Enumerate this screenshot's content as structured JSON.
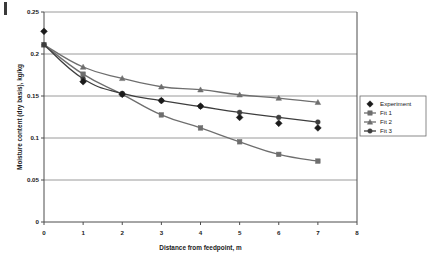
{
  "chart_data": {
    "type": "line",
    "title": "",
    "xlabel": "Distance from feedpoint, m",
    "ylabel": "Moisture content (dry basis), kg/kg",
    "xlim": [
      0,
      8
    ],
    "ylim": [
      0,
      0.25
    ],
    "xticks": [
      "0",
      "1",
      "2",
      "3",
      "4",
      "5",
      "6",
      "7",
      "8"
    ],
    "xtick_values": [
      0,
      1,
      2,
      3,
      4,
      5,
      6,
      7,
      8
    ],
    "yticks": [
      "0",
      "0.05",
      "0.1",
      "0.15",
      "0.2",
      "0.25"
    ],
    "ytick_values": [
      0,
      0.05,
      0.1,
      0.15,
      0.2,
      0.25
    ],
    "grid": "horizontal",
    "legend_position": "right-middle",
    "x": [
      0,
      1,
      2,
      3,
      4,
      5,
      6,
      7
    ],
    "series": [
      {
        "name": "Experiment",
        "marker": "diamond",
        "color": "#1a1a1a",
        "line": false,
        "values": [
          0.227,
          0.167,
          0.152,
          0.1445,
          0.138,
          0.1245,
          0.1175,
          0.112
        ]
      },
      {
        "name": "Fit 1",
        "marker": "square",
        "color": "#6e6e6e",
        "line": true,
        "values": [
          0.211,
          0.176,
          0.152,
          0.1275,
          0.112,
          0.0955,
          0.0805,
          0.0725
        ]
      },
      {
        "name": "Fit 2",
        "marker": "triangle",
        "color": "#6e6e6e",
        "line": true,
        "values": [
          0.211,
          0.1845,
          0.171,
          0.161,
          0.1575,
          0.1515,
          0.1475,
          0.1425
        ]
      },
      {
        "name": "Fit 3",
        "marker": "circle",
        "color": "#3d3d3d",
        "line": true,
        "values": [
          0.211,
          0.1705,
          0.153,
          0.1445,
          0.1375,
          0.1305,
          0.1245,
          0.119
        ]
      }
    ]
  },
  "legend": {
    "items": [
      {
        "label": "Experiment"
      },
      {
        "label": "Fit 1"
      },
      {
        "label": "Fit 2"
      },
      {
        "label": "Fit 3"
      }
    ]
  },
  "colors": {
    "axis": "#4d4d4d",
    "grid": "#9a9a9a",
    "experiment": "#1a1a1a",
    "fit1": "#6e6e6e",
    "fit2": "#6e6e6e",
    "fit3": "#3d3d3d",
    "background": "#ffffff"
  }
}
